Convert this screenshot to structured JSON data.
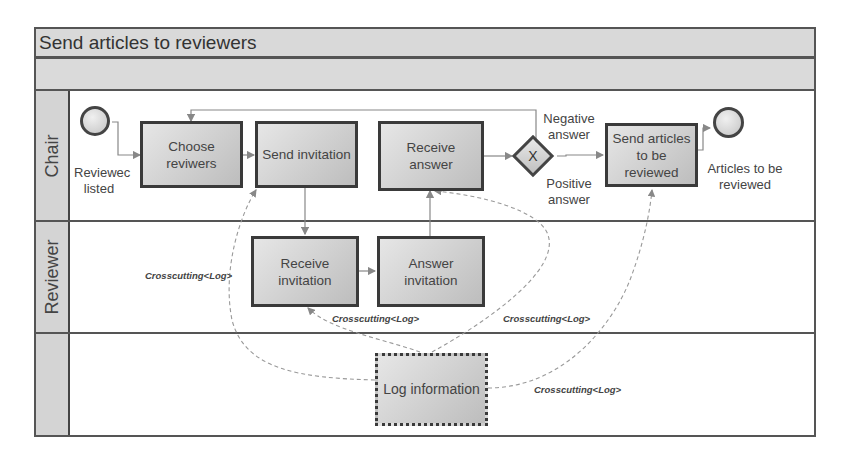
{
  "diagram": {
    "title": "Send articles to reviewers",
    "lanes": [
      {
        "name": "Chair"
      },
      {
        "name": "Reviewer"
      },
      {
        "name": ""
      }
    ],
    "start_event": {
      "label_line1": "Reviewec",
      "label_line2": "listed"
    },
    "end_event": {
      "label_line1": "Articles to be",
      "label_line2": "reviewed"
    },
    "tasks": {
      "choose_reviewers": {
        "line1": "Choose",
        "line2": "reviwers"
      },
      "send_invitation": {
        "line1": "Send invitation"
      },
      "receive_answer": {
        "line1": "Receive",
        "line2": "answer"
      },
      "send_articles": {
        "line1": "Send articles",
        "line2": "to be",
        "line3": "reviewed"
      },
      "receive_invitation": {
        "line1": "Receive",
        "line2": "invitation"
      },
      "answer_invitation": {
        "line1": "Answer",
        "line2": "invitation"
      },
      "log_information": {
        "line1": "Log information"
      }
    },
    "gateway": {
      "symbol": "X",
      "negative_line1": "Negative",
      "negative_line2": "answer",
      "positive_line1": "Positive",
      "positive_line2": "answer"
    },
    "crosscutting_labels": [
      "Crosscutting<Log>",
      "Crosscutting<Log>",
      "Crosscutting<Log>",
      "Crosscutting<Log>"
    ],
    "colors": {
      "border": "#555555",
      "band_fill": "#d9d9d9",
      "task_fill": "#cfcfcf",
      "connector": "#888888"
    }
  }
}
